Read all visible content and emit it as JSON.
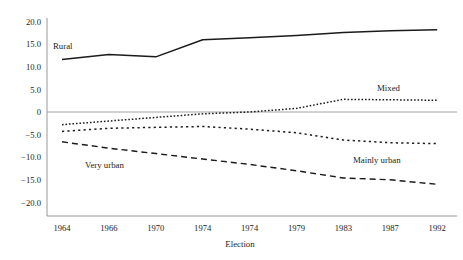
{
  "chart_data": {
    "type": "line",
    "title": "",
    "subtitle": "",
    "xlabel": "Election",
    "ylabel": "",
    "grid": false,
    "legend_position": "inline-annotations",
    "categories": [
      "1964",
      "1966",
      "1970",
      "1974",
      "1974",
      "1979",
      "1983",
      "1987",
      "1992"
    ],
    "x_tick_labels": [
      "1964",
      "1966",
      "1970",
      "1974",
      "1974",
      "1979",
      "1983",
      "1987",
      "1992"
    ],
    "y_tick_labels": [
      "20.0",
      "15.0",
      "10.0",
      "5.0",
      "0",
      "-5.0",
      "-10.0",
      "-15.0",
      "-20.0"
    ],
    "y_tick_values": [
      20,
      15,
      10,
      5,
      0,
      -5,
      -10,
      -15,
      -20
    ],
    "ylim": [
      -20,
      20
    ],
    "zero_reference_line": 0,
    "series": [
      {
        "name": "Rural",
        "style": "solid",
        "label_x": "1964",
        "values": [
          11.6,
          12.7,
          12.2,
          16.0,
          16.4,
          16.9,
          17.6,
          18.0,
          18.2
        ]
      },
      {
        "name": "Mixed",
        "style": "dotted-fine",
        "label_x": "1983",
        "values": [
          -2.8,
          -2.0,
          -1.2,
          -0.4,
          0.0,
          0.8,
          2.8,
          2.7,
          2.6
        ]
      },
      {
        "name": "Mainly urban",
        "style": "dotted-coarse",
        "label_x": "1983",
        "values": [
          -4.3,
          -3.6,
          -3.4,
          -3.2,
          -3.8,
          -4.6,
          -6.2,
          -6.8,
          -7.0
        ]
      },
      {
        "name": "Very urban",
        "style": "dashed",
        "label_x": "1966",
        "values": [
          -6.6,
          -8.0,
          -9.2,
          -10.4,
          -11.6,
          -13.0,
          -14.6,
          -15.0,
          -16.0
        ]
      }
    ]
  },
  "annotations": {
    "rural": "Rural",
    "mixed": "Mixed",
    "mainly_urban": "Mainly urban",
    "very_urban": "Very urban"
  },
  "axis": {
    "x_title": "Election",
    "y_ticks": [
      {
        "label": "20.0",
        "value": 20
      },
      {
        "label": "15.0",
        "value": 15
      },
      {
        "label": "10.0",
        "value": 10
      },
      {
        "label": "5.0",
        "value": 5
      },
      {
        "label": "0",
        "value": 0
      },
      {
        "label": "-5.0",
        "value": -5
      },
      {
        "label": "-10.0",
        "value": -10
      },
      {
        "label": "-15.0",
        "value": -15
      },
      {
        "label": "-20.0",
        "value": -20
      }
    ],
    "x_ticks": [
      {
        "label": "1964"
      },
      {
        "label": "1966"
      },
      {
        "label": "1970"
      },
      {
        "label": "1974"
      },
      {
        "label": "1974"
      },
      {
        "label": "1979"
      },
      {
        "label": "1983"
      },
      {
        "label": "1987"
      },
      {
        "label": "1992"
      }
    ]
  }
}
